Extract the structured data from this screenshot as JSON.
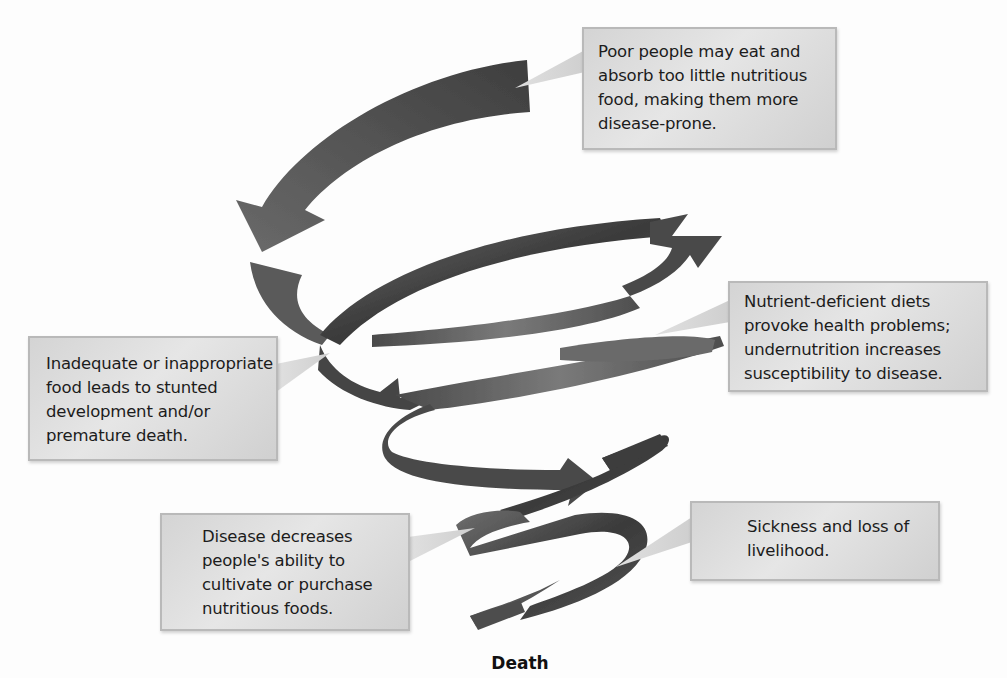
{
  "diagram": {
    "type": "downward spiral cycle",
    "colors": {
      "background": "#fdfdfd",
      "arrow_dark": "#3a3a3a",
      "arrow_mid": "#6a6a6a",
      "arrow_light": "#9a9a9a",
      "callout_fill": "#dcdcdc",
      "callout_border": "#b9b9b9",
      "text": "#1c1c1c"
    },
    "callouts": [
      {
        "id": "top",
        "text": "Poor people may eat and absorb too little nutritious food, making them more disease-prone."
      },
      {
        "id": "right",
        "text": "Nutrient-deficient diets provoke health problems; undernutrition increases susceptibility to disease."
      },
      {
        "id": "left",
        "text": "Inadequate or inappropriate food leads to stunted development and/or premature death."
      },
      {
        "id": "bottom-left",
        "text": "Disease decreases people's ability to cultivate or purchase nutritious foods."
      },
      {
        "id": "bottom-right",
        "text": "Sickness and loss of livelihood."
      }
    ],
    "end_label": "Death"
  }
}
